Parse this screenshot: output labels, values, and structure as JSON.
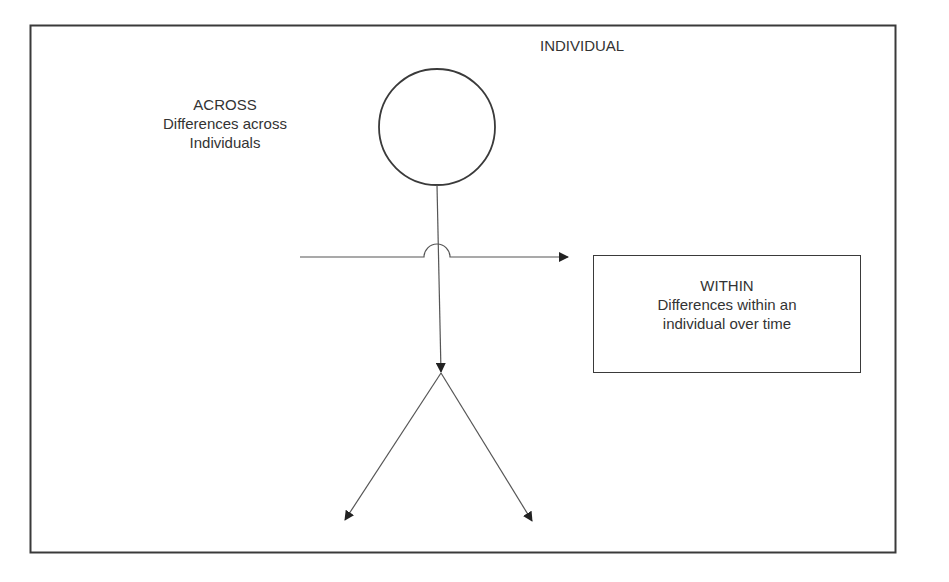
{
  "diagram": {
    "title": "INDIVIDUAL",
    "across": {
      "heading": "ACROSS",
      "line1": "Differences across",
      "line2": "Individuals"
    },
    "within": {
      "heading": "WITHIN",
      "line1": "Differences within an",
      "line2": "individual over time"
    },
    "figure": {
      "type": "stick-figure",
      "parts": [
        "head",
        "body",
        "arms-horizontal-arrow",
        "left-leg-arrow",
        "right-leg-arrow"
      ]
    },
    "colors": {
      "stroke": "#3a3a3a",
      "text": "#333333",
      "background": "#ffffff"
    }
  }
}
